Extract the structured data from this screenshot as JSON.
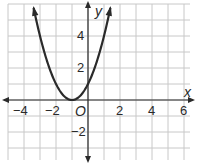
{
  "chart_data": {
    "type": "line",
    "title": "",
    "xlabel": "x",
    "ylabel": "y",
    "origin_label": "O",
    "xlim": [
      -5,
      6.5
    ],
    "ylim": [
      -4.2,
      6
    ],
    "grid": true,
    "grid_step": 1,
    "x_ticks": [
      {
        "value": -4,
        "label": "−4"
      },
      {
        "value": -2,
        "label": "−2"
      },
      {
        "value": 2,
        "label": "2"
      },
      {
        "value": 4,
        "label": "4"
      },
      {
        "value": 6,
        "label": "6"
      }
    ],
    "y_ticks": [
      {
        "value": 4,
        "label": "4"
      },
      {
        "value": 2,
        "label": "2"
      },
      {
        "value": -2,
        "label": "−2"
      }
    ],
    "series": [
      {
        "name": "y = (x + 1)^2",
        "equation": "y = (x+1)^2",
        "vertex": [
          -1,
          0
        ],
        "x": [
          -3.4,
          -3,
          -2.5,
          -2,
          -1.5,
          -1,
          -0.5,
          0,
          0.5,
          1,
          1.4
        ],
        "y": [
          5.76,
          4,
          2.25,
          1,
          0.25,
          0,
          0.25,
          1,
          2.25,
          4,
          5.76
        ],
        "arrows_at_ends": true
      }
    ]
  },
  "colors": {
    "grid": "#c8c8c8",
    "axis": "#2a2a2a",
    "curve": "#2a2a2a",
    "background": "#ffffff"
  }
}
